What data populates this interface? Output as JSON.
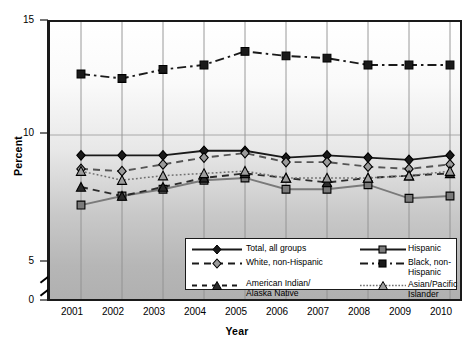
{
  "chart_data": {
    "type": "line",
    "title": "",
    "xlabel": "Year",
    "ylabel": "Percent",
    "categories": [
      "2001",
      "2002",
      "2003",
      "2004",
      "2005",
      "2006",
      "2007",
      "2008",
      "2009",
      "2010"
    ],
    "x_tick_labels": [
      "2001",
      "2002",
      "2003",
      "2004",
      "2005",
      "2006",
      "2007",
      "2008",
      "2009",
      "2010"
    ],
    "y_tick_labels": [
      "0",
      "5",
      "10",
      "15"
    ],
    "y_tick_values": [
      0,
      5,
      10,
      15
    ],
    "ylim": [
      0,
      15
    ],
    "axis_break": true,
    "axis_break_between": [
      0,
      5
    ],
    "grid": "vertical",
    "legend_position": "inside-bottom-right",
    "series": [
      {
        "name": "Total, all groups",
        "marker": "diamond",
        "line": "solid",
        "color": "#1a1a1a",
        "values": [
          9.1,
          9.1,
          9.1,
          9.3,
          9.3,
          9.0,
          9.1,
          9.0,
          8.9,
          9.1
        ]
      },
      {
        "name": "Hispanic",
        "marker": "square",
        "line": "solid",
        "color": "#7a7a7a",
        "values": [
          6.9,
          7.3,
          7.6,
          8.0,
          8.1,
          7.6,
          7.6,
          7.8,
          7.2,
          7.3
        ]
      },
      {
        "name": "White, non-Hispanic",
        "marker": "diamond-open",
        "line": "dashed",
        "color": "#555555",
        "values": [
          8.5,
          8.4,
          8.7,
          9.0,
          9.2,
          8.8,
          8.8,
          8.6,
          8.5,
          8.7
        ]
      },
      {
        "name": "Black, non-Hispanic",
        "marker": "square",
        "line": "dash-dot",
        "color": "#1a1a1a",
        "values": [
          12.7,
          12.5,
          12.9,
          13.1,
          13.7,
          13.5,
          13.4,
          13.1,
          13.1,
          13.1
        ]
      },
      {
        "name": "American Indian/\nAlaska Native",
        "marker": "triangle",
        "line": "dashed",
        "color": "#2b2b2b",
        "values": [
          7.7,
          7.3,
          7.7,
          8.1,
          8.3,
          8.1,
          7.9,
          8.1,
          8.2,
          8.3
        ]
      },
      {
        "name": "Asian/Pacific Islander",
        "marker": "triangle-open",
        "line": "dotted",
        "color": "#6f6f6f",
        "values": [
          8.4,
          8.0,
          8.2,
          8.3,
          8.4,
          8.1,
          8.1,
          8.1,
          8.2,
          8.4
        ]
      }
    ]
  },
  "legend": {
    "items": [
      {
        "label": "Total, all groups"
      },
      {
        "label": "Hispanic"
      },
      {
        "label": "White, non-Hispanic"
      },
      {
        "label": "Black, non-Hispanic"
      },
      {
        "label": "American Indian/",
        "label2": "Alaska Native"
      },
      {
        "label": "Asian/Pacific Islander"
      }
    ]
  }
}
